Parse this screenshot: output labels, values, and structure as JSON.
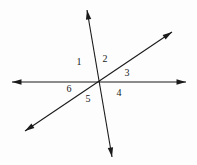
{
  "figure": {
    "background_color": "#fdfdfd",
    "stroke_color": "#1a1a1a",
    "label_color": "#1a1a1a",
    "width": 197,
    "height": 165,
    "intersection": {
      "x": 98,
      "y": 82
    },
    "lines": [
      {
        "name": "horizontal-line",
        "x1": 12,
        "y1": 82,
        "x2": 186,
        "y2": 82,
        "arrow_start": true,
        "arrow_end": true
      },
      {
        "name": "steep-line",
        "x1": 87,
        "y1": 10,
        "x2": 112,
        "y2": 157,
        "arrow_start": true,
        "arrow_end": true
      },
      {
        "name": "diagonal-line",
        "x1": 25,
        "y1": 131,
        "x2": 172,
        "y2": 32,
        "arrow_start": true,
        "arrow_end": true
      }
    ],
    "labels": [
      {
        "name": "angle-label-1",
        "text": "1",
        "x": 79,
        "y": 63
      },
      {
        "name": "angle-label-2",
        "text": "2",
        "x": 105,
        "y": 60
      },
      {
        "name": "angle-label-3",
        "text": "3",
        "x": 127,
        "y": 74
      },
      {
        "name": "angle-label-4",
        "text": "4",
        "x": 119,
        "y": 94
      },
      {
        "name": "angle-label-5",
        "text": "5",
        "x": 88,
        "y": 100
      },
      {
        "name": "angle-label-6",
        "text": "6",
        "x": 69,
        "y": 90
      }
    ]
  }
}
